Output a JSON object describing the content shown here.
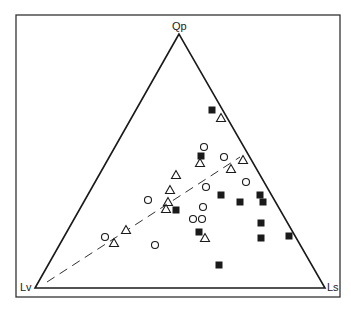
{
  "chart_data": {
    "type": "scatter",
    "subtype": "ternary",
    "title": "",
    "vertices": {
      "top": "Qp",
      "bottom_left": "Lv",
      "bottom_right": "Ls"
    },
    "frame": {
      "x": 16,
      "y": 15,
      "width": 324,
      "height": 282
    },
    "triangle_px": {
      "top": [
        179,
        34
      ],
      "bottom_left": [
        35,
        288
      ],
      "bottom_right": [
        325,
        288
      ]
    },
    "trend_line": {
      "style": "dashed",
      "from_px": [
        47,
        282
      ],
      "to_px": [
        240,
        157
      ]
    },
    "series": [
      {
        "name": "filled squares",
        "marker": "square-filled",
        "points_px": [
          [
            212,
            110
          ],
          [
            201,
            156
          ],
          [
            221,
            195
          ],
          [
            176,
            210
          ],
          [
            240,
            202
          ],
          [
            260,
            195
          ],
          [
            263,
            202
          ],
          [
            261,
            223
          ],
          [
            199,
            232
          ],
          [
            261,
            238
          ],
          [
            289,
            236
          ],
          [
            219,
            265
          ]
        ]
      },
      {
        "name": "open circles",
        "marker": "circle-open",
        "points_px": [
          [
            204,
            147
          ],
          [
            224,
            157
          ],
          [
            206,
            187
          ],
          [
            246,
            182
          ],
          [
            203,
            207
          ],
          [
            193,
            219
          ],
          [
            202,
            219
          ],
          [
            148,
            200
          ],
          [
            105,
            237
          ],
          [
            155,
            245
          ]
        ]
      },
      {
        "name": "open triangles",
        "marker": "triangle-open",
        "points_px": [
          [
            221,
            118
          ],
          [
            200,
            163
          ],
          [
            243,
            160
          ],
          [
            231,
            169
          ],
          [
            176,
            175
          ],
          [
            170,
            190
          ],
          [
            168,
            202
          ],
          [
            166,
            209
          ],
          [
            126,
            230
          ],
          [
            114,
            243
          ],
          [
            205,
            238
          ]
        ]
      }
    ],
    "colors": {
      "line": "#1a1a1a",
      "marker": "#1a1a1a",
      "background": "#ffffff"
    }
  },
  "labels": {
    "top": "Qp",
    "bottom_left": "Lv",
    "bottom_right": "Ls"
  }
}
